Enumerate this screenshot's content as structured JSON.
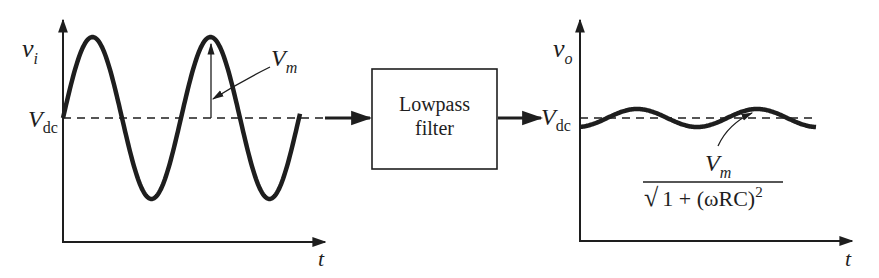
{
  "input_plot": {
    "y_label": {
      "main": "v",
      "sub": "i"
    },
    "x_label": "t",
    "dc_label": {
      "main": "V",
      "sub": "dc"
    },
    "amplitude_label": {
      "main": "V",
      "sub": "m"
    },
    "signal": "sine wave offset by Vdc with amplitude Vm, ~2.5 periods"
  },
  "filter_block": {
    "line1": "Lowpass",
    "line2": "filter"
  },
  "output_plot": {
    "y_label": {
      "main": "v",
      "sub": "o"
    },
    "x_label": "t",
    "dc_label": {
      "main": "V",
      "sub": "dc"
    },
    "ripple_formula": {
      "numerator": {
        "main": "V",
        "sub": "m"
      },
      "denominator_radical": "√",
      "denominator": "1 + (ωRC)",
      "denominator_exp": "2"
    },
    "signal": "small-ripple sine around Vdc"
  },
  "colors": {
    "ink": "#1e1e1e",
    "background": "#ffffff"
  }
}
